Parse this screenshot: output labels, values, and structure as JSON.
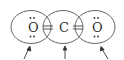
{
  "diagram": {
    "atoms": [
      {
        "symbol": "O",
        "x": 33,
        "lone_pairs": [
          "top",
          "bottom"
        ]
      },
      {
        "symbol": "C",
        "x": 64,
        "lone_pairs": []
      },
      {
        "symbol": "O",
        "x": 96,
        "lone_pairs": [
          "top",
          "bottom"
        ]
      }
    ],
    "bonds": [
      {
        "from": 0,
        "to": 1,
        "type": "double"
      },
      {
        "from": 1,
        "to": 2,
        "type": "double"
      }
    ],
    "octet_circles": 3,
    "arrows": 3,
    "colors": {
      "line": "#444444",
      "text": "#333333",
      "background": "#ffffff"
    }
  }
}
